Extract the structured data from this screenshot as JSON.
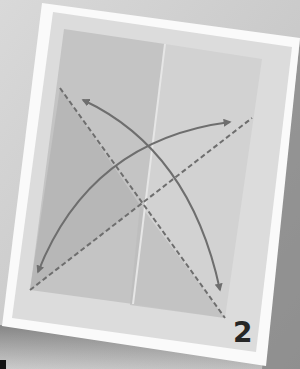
{
  "diagram": {
    "type": "origami-instruction-step",
    "step_number": "2",
    "instruction_marks": [
      {
        "kind": "valley-fold-line",
        "style": "dashed",
        "from": "top-left-corner",
        "to": "bottom-right-corner"
      },
      {
        "kind": "valley-fold-line",
        "style": "dashed",
        "from": "bottom-left-corner",
        "to": "top-right-corner"
      },
      {
        "kind": "fold-unfold-arrow",
        "style": "double-headed-curved",
        "between": [
          "top-left",
          "bottom-right"
        ]
      },
      {
        "kind": "fold-unfold-arrow",
        "style": "double-headed-curved",
        "between": [
          "bottom-left",
          "top-right"
        ]
      }
    ],
    "colors": {
      "background": "#cfcfcf",
      "card": "#fafafa",
      "panel": "#dcdcdc",
      "paper_light": "#cdcdcd",
      "paper_dark": "#b4b4b4",
      "lines": "#6e6e6e",
      "number": "#262626"
    }
  }
}
